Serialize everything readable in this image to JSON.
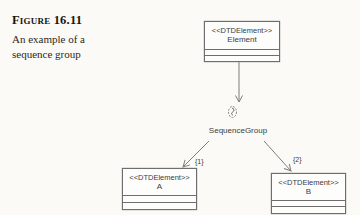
{
  "caption": {
    "figure_label": "Figure 16.11",
    "text_line1": "An example of a",
    "text_line2": "sequence group"
  },
  "diagram": {
    "nodes": [
      {
        "id": "element",
        "stereotype": "<<DTDElement>>",
        "name": "Element"
      },
      {
        "id": "a",
        "stereotype": "<<DTDElement>>",
        "name": "A"
      },
      {
        "id": "b",
        "stereotype": "<<DTDElement>>",
        "name": "B"
      }
    ],
    "sequence_group_label": "SequenceGroup",
    "edge_label_to_a": "{1}",
    "edge_label_to_b": "{2}",
    "icons": {
      "group_icon": "sequence-group-icon"
    },
    "colors": {
      "line": "#7d7d7d",
      "box_border": "#6e6e6e",
      "box_fill": "#fdfdfc",
      "text": "#3c3c3c",
      "caption_text": "#2a221b",
      "background": "#fbfaf6"
    }
  }
}
